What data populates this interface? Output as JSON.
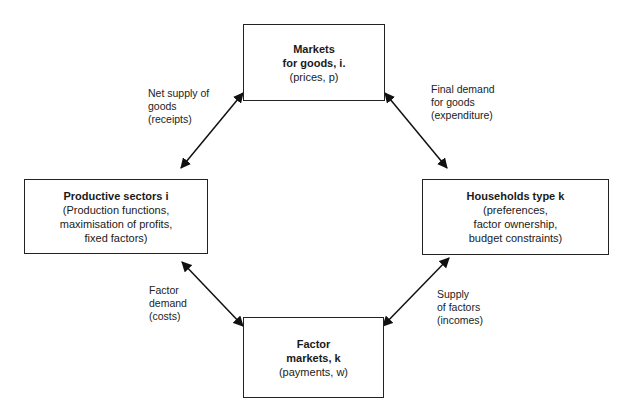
{
  "diagram": {
    "nodes": {
      "markets_goods": {
        "title_lines": [
          "Markets",
          "for goods, i."
        ],
        "detail_lines": [
          "(prices, p)"
        ]
      },
      "productive_sectors": {
        "title_lines": [
          "Productive sectors i"
        ],
        "detail_lines": [
          "(Production functions,",
          "maximisation of profits,",
          "fixed factors)"
        ]
      },
      "households": {
        "title_lines": [
          "Households type k"
        ],
        "detail_lines": [
          "(preferences,",
          "factor ownership,",
          "budget constraints)"
        ]
      },
      "factor_markets": {
        "title_lines": [
          "Factor",
          "markets, k"
        ],
        "detail_lines": [
          "(payments, w)"
        ]
      }
    },
    "edges": {
      "net_supply": {
        "lines": [
          "Net supply of",
          "goods",
          "(receipts)"
        ]
      },
      "final_demand": {
        "lines": [
          "Final demand",
          "for goods",
          "(expenditure)"
        ]
      },
      "factor_demand": {
        "lines": [
          "Factor",
          "demand",
          "(costs)"
        ]
      },
      "supply_factors": {
        "lines": [
          "Supply",
          "of factors",
          "(incomes)"
        ]
      }
    }
  }
}
